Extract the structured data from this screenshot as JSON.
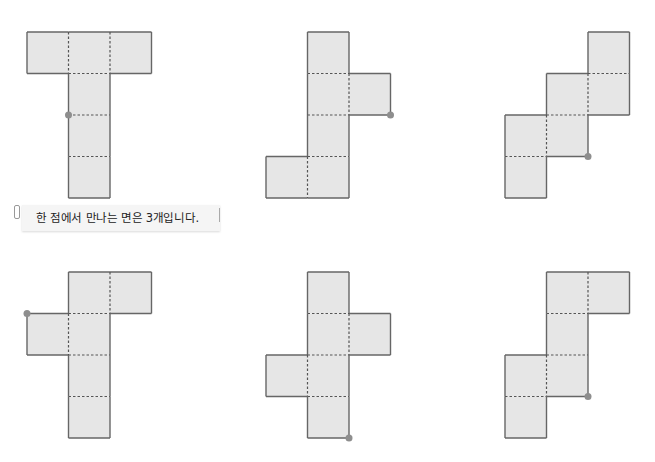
{
  "callout": {
    "text": "한 점에서 만나는 면은 3개입니다."
  },
  "style": {
    "face_fill": "#e6e6e6",
    "edge_color": "#666666",
    "fold_color": "#555555",
    "dot_color": "#8e8e8e",
    "cell_size": 41.5
  },
  "nets": [
    {
      "name": "net-1",
      "origin": [
        27,
        32
      ],
      "cells": [
        [
          0,
          0
        ],
        [
          1,
          0
        ],
        [
          2,
          0
        ],
        [
          1,
          1
        ],
        [
          1,
          2
        ],
        [
          1,
          3
        ]
      ],
      "dot": [
        1,
        2
      ]
    },
    {
      "name": "net-2",
      "origin": [
        266,
        32
      ],
      "cells": [
        [
          1,
          0
        ],
        [
          1,
          1
        ],
        [
          2,
          1
        ],
        [
          1,
          2
        ],
        [
          0,
          3
        ],
        [
          1,
          3
        ]
      ],
      "dot": [
        3,
        2
      ]
    },
    {
      "name": "net-3",
      "origin": [
        505,
        32
      ],
      "cells": [
        [
          2,
          0
        ],
        [
          1,
          1
        ],
        [
          2,
          1
        ],
        [
          0,
          2
        ],
        [
          1,
          2
        ],
        [
          0,
          3
        ]
      ],
      "dot": [
        2,
        3
      ]
    },
    {
      "name": "net-4",
      "origin": [
        27,
        272
      ],
      "cells": [
        [
          1,
          0
        ],
        [
          2,
          0
        ],
        [
          0,
          1
        ],
        [
          1,
          1
        ],
        [
          1,
          2
        ],
        [
          1,
          3
        ]
      ],
      "dot": [
        0,
        1
      ]
    },
    {
      "name": "net-5",
      "origin": [
        266,
        272
      ],
      "cells": [
        [
          1,
          0
        ],
        [
          1,
          1
        ],
        [
          2,
          1
        ],
        [
          0,
          2
        ],
        [
          1,
          2
        ],
        [
          1,
          3
        ]
      ],
      "dot": [
        2,
        4
      ]
    },
    {
      "name": "net-6",
      "origin": [
        505,
        272
      ],
      "cells": [
        [
          1,
          0
        ],
        [
          2,
          0
        ],
        [
          1,
          1
        ],
        [
          0,
          2
        ],
        [
          1,
          2
        ],
        [
          0,
          3
        ]
      ],
      "dot": [
        2,
        3
      ]
    }
  ]
}
